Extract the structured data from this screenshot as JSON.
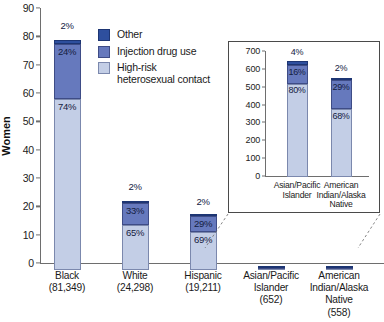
{
  "chart_data": {
    "type": "bar",
    "title": "",
    "subtitle": "",
    "xlabel": "",
    "ylabel": "Women",
    "stacked": true,
    "grid": false,
    "legend_position": "top-center",
    "categories": [
      "Black\n(81,349)",
      "White\n(24,298)",
      "Hispanic\n(19,211)",
      "Asian/Pacific\nIslander\n(652)",
      "American\nIndian/Alaska\nNative\n(558)"
    ],
    "category_names": [
      "Black",
      "White",
      "Hispanic",
      "Asian/Pacific Islander",
      "American Indian/Alaska Native"
    ],
    "category_counts": [
      "(81,349)",
      "(24,298)",
      "(19,211)",
      "(652)",
      "(558)"
    ],
    "ylim": [
      0,
      90
    ],
    "yticks": [
      0,
      10,
      20,
      30,
      40,
      50,
      60,
      70,
      80,
      90
    ],
    "ytick_labels": [
      "0",
      "10",
      "20",
      "30",
      "40",
      "50",
      "60",
      "70",
      "80",
      "90"
    ],
    "units_note": "thousands",
    "series": [
      {
        "name": "High-risk heterosexual contact",
        "color": "#c3cee6",
        "values": [
          60.2,
          15.8,
          13.3,
          0.52,
          0.38
        ],
        "percent_labels": [
          "74%",
          "65%",
          "69%",
          "",
          ""
        ]
      },
      {
        "name": "Injection drug use",
        "color": "#6679bd",
        "values": [
          19.5,
          8.0,
          5.6,
          0.1,
          0.16
        ],
        "percent_labels": [
          "24%",
          "33%",
          "29%",
          "",
          ""
        ]
      },
      {
        "name": "Other",
        "color": "#2e4f9e",
        "values": [
          1.6,
          0.5,
          0.4,
          0.03,
          0.01
        ],
        "percent_labels": [
          "2%",
          "2%",
          "2%",
          "",
          ""
        ]
      }
    ],
    "bar_totals": [
      81.3,
      24.3,
      19.2,
      0.65,
      0.56
    ],
    "top_labels": [
      "2%",
      "2%",
      "2%",
      "",
      ""
    ]
  },
  "inset_chart": {
    "type": "bar",
    "stacked": true,
    "ylabel": "",
    "ylim": [
      0,
      700
    ],
    "yticks": [
      0,
      100,
      200,
      300,
      400,
      500,
      600,
      700
    ],
    "ytick_labels": [
      "0",
      "100",
      "200",
      "300",
      "400",
      "500",
      "600",
      "700"
    ],
    "categories": [
      "Asian/Pacific\nIslander",
      "American\nIndian/Alaska\nNative"
    ],
    "category_names": [
      "Asian/Pacific Islander",
      "American Indian/Alaska Native"
    ],
    "series": [
      {
        "name": "High-risk heterosexual contact",
        "color": "#c3cee6",
        "values": [
          522,
          379
        ],
        "percent_labels": [
          "80%",
          "68%"
        ]
      },
      {
        "name": "Injection drug use",
        "color": "#6679bd",
        "values": [
          104,
          162
        ],
        "percent_labels": [
          "16%",
          "29%"
        ]
      },
      {
        "name": "Other",
        "color": "#2e4f9e",
        "values": [
          26,
          11
        ],
        "percent_labels": [
          "4%",
          "2%"
        ]
      }
    ],
    "bar_totals": [
      652,
      558
    ],
    "top_labels": [
      "4%",
      "2%"
    ]
  },
  "legend": {
    "items": [
      {
        "label": "Other",
        "color": "#2e4f9e",
        "swatch": "other"
      },
      {
        "label": "Injection drug use",
        "color": "#6679bd",
        "swatch": "idu"
      },
      {
        "label": "High-risk\nheterosexual contact",
        "color": "#c3cee6",
        "swatch": "hrh"
      }
    ]
  },
  "axis": {
    "y_label_main": "Women"
  }
}
